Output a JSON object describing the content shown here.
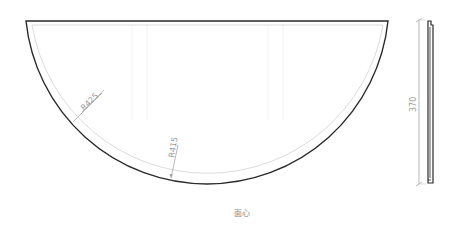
{
  "drawing": {
    "title_caption": "面心",
    "colors": {
      "outline": "#2a2a2a",
      "inner_offset": "#d8d8d8",
      "dimension": "#9a9a9a",
      "background": "#ffffff"
    },
    "front_view": {
      "shape": "circular segment (half-round tabletop)",
      "top_edge": {
        "x1": 26,
        "y1": 21,
        "x2": 388,
        "y2": 21
      },
      "outer_radius_label": "R425",
      "inner_radius_label": "R415"
    },
    "side_view": {
      "height_dimension_label": "370"
    }
  }
}
